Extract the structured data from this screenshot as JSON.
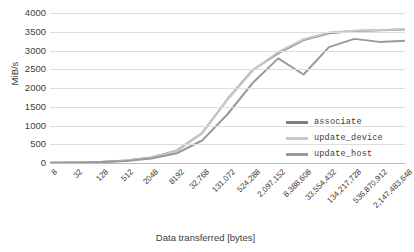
{
  "chart_data": {
    "type": "line",
    "title": "",
    "xlabel": "Data transferred [bytes]",
    "ylabel": "MiB/s",
    "xscale": "log2-category",
    "grid": true,
    "legend_position": "inside-right",
    "ylim": [
      0,
      4000
    ],
    "yticks": [
      4000,
      3500,
      3000,
      2500,
      2000,
      1500,
      1000,
      500,
      0
    ],
    "categories": [
      "8",
      "32",
      "128",
      "512",
      "2048",
      "8192",
      "32,768",
      "131,072",
      "524,288",
      "2,097,152",
      "8,388,608",
      "33,554,432",
      "134,217,728",
      "536,870,912",
      "2,147,483,648"
    ],
    "series": [
      {
        "name": "associate",
        "color": "#7f7f7f",
        "values": [
          8,
          12,
          30,
          70,
          150,
          330,
          800,
          1700,
          2480,
          2930,
          3280,
          3460,
          3520,
          3540,
          3560
        ]
      },
      {
        "name": "update_device",
        "color": "#c9c9c9",
        "values": [
          7,
          11,
          28,
          66,
          142,
          320,
          790,
          1690,
          2470,
          2960,
          3300,
          3480,
          3530,
          3550,
          3570
        ]
      },
      {
        "name": "update_host",
        "color": "#9a9a9a",
        "values": [
          6,
          10,
          24,
          56,
          120,
          260,
          600,
          1300,
          2140,
          2790,
          2360,
          3090,
          3310,
          3230,
          3260
        ]
      }
    ]
  },
  "legend": {
    "items": [
      {
        "label": "associate",
        "color": "#7f7f7f"
      },
      {
        "label": "update_device",
        "color": "#c9c9c9"
      },
      {
        "label": "update_host",
        "color": "#9a9a9a"
      }
    ]
  },
  "colors": {
    "gridline": "#dedede",
    "axis": "#bdbdbd",
    "text": "#404040",
    "background": "#ffffff"
  }
}
